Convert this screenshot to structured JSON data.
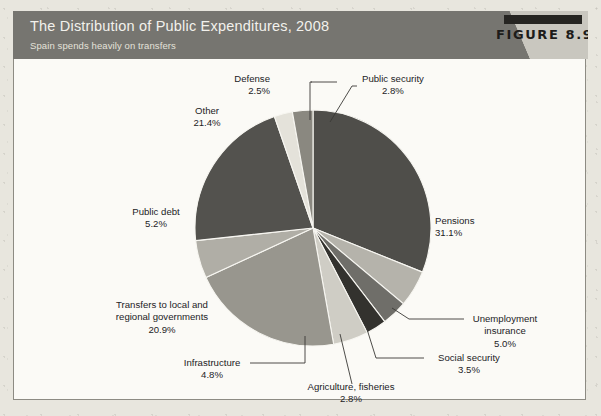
{
  "header": {
    "title": "The Distribution of Public Expenditures, 2008",
    "subtitle": "Spain spends heavily on transfers",
    "figure_label": "FIGURE 8.9",
    "bar_color": "#767570",
    "wedge_color": "#c9c7bf"
  },
  "chart_data": {
    "type": "pie",
    "title": "The Distribution of Public Expenditures, 2008",
    "subtitle": "Spain spends heavily on transfers",
    "unit": "percent of total public expenditure",
    "total": 100.0,
    "legend": "none (direct labels with leader lines)",
    "start_angle_deg": -90,
    "direction": "clockwise",
    "categories": [
      "Pensions",
      "Unemployment insurance",
      "Social security",
      "Agriculture, fisheries",
      "Infrastructure",
      "Transfers to local and regional governments",
      "Public debt",
      "Other",
      "Defense",
      "Public security"
    ],
    "values": [
      31.1,
      5.0,
      3.5,
      2.8,
      4.8,
      20.9,
      5.2,
      21.4,
      2.5,
      2.8
    ],
    "slices": [
      {
        "label": "Pensions",
        "value": 31.1,
        "pct_text": "31.1%",
        "color": "#4f4e4a"
      },
      {
        "label": "Unemployment insurance",
        "value": 5.0,
        "pct_text": "5.0%",
        "color": "#b5b3ab"
      },
      {
        "label": "Social security",
        "value": 3.5,
        "pct_text": "3.5%",
        "color": "#6f6e69"
      },
      {
        "label": "Agriculture, fisheries",
        "value": 2.8,
        "pct_text": "2.8%",
        "color": "#33322e"
      },
      {
        "label": "Infrastructure",
        "value": 4.8,
        "pct_text": "4.8%",
        "color": "#cfcdc5"
      },
      {
        "label": "Transfers to local and regional governments",
        "value": 20.9,
        "pct_text": "20.9%",
        "color": "#98968e"
      },
      {
        "label": "Public debt",
        "value": 5.2,
        "pct_text": "5.2%",
        "color": "#b0aea6"
      },
      {
        "label": "Other",
        "value": 21.4,
        "pct_text": "21.4%",
        "color": "#53524e"
      },
      {
        "label": "Defense",
        "value": 2.5,
        "pct_text": "2.5%",
        "color": "#e4e2da"
      },
      {
        "label": "Public security",
        "value": 2.8,
        "pct_text": "2.8%",
        "color": "#8a8880"
      }
    ]
  },
  "callouts": {
    "defense": {
      "label": "Defense",
      "pct": "2.5%"
    },
    "public_security": {
      "label": "Public security",
      "pct": "2.8%"
    },
    "other": {
      "label": "Other",
      "pct": "21.4%"
    },
    "public_debt": {
      "label": "Public debt",
      "pct": "5.2%"
    },
    "transfers_l1": {
      "label": "Transfers to local and"
    },
    "transfers_l2": {
      "label": "regional governments",
      "pct": "20.9%"
    },
    "infrastructure": {
      "label": "Infrastructure",
      "pct": "4.8%"
    },
    "agriculture": {
      "label": "Agriculture, fisheries",
      "pct": "2.8%"
    },
    "social_security": {
      "label": "Social security",
      "pct": "3.5%"
    },
    "unemployment_l1": {
      "label": "Unemployment"
    },
    "unemployment_l2": {
      "label": "insurance",
      "pct": "5.0%"
    },
    "pensions": {
      "label": "Pensions",
      "pct": "31.1%"
    }
  }
}
